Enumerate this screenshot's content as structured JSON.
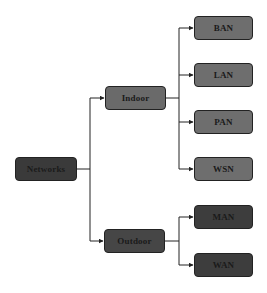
{
  "diagram": {
    "type": "tree",
    "root": {
      "label": "Networks",
      "color": "#3a3a3a",
      "box": {
        "x": 15,
        "y": 157,
        "w": 62,
        "h": 24
      },
      "children": [
        {
          "label": "Indoor",
          "color": "#6a6a6a",
          "box": {
            "x": 105,
            "y": 86,
            "w": 61,
            "h": 24
          },
          "children": [
            {
              "label": "BAN",
              "color": "#6e6e6e",
              "box": {
                "x": 194,
                "y": 16,
                "w": 59,
                "h": 24
              }
            },
            {
              "label": "LAN",
              "color": "#6e6e6e",
              "box": {
                "x": 194,
                "y": 63,
                "w": 59,
                "h": 24
              }
            },
            {
              "label": "PAN",
              "color": "#6e6e6e",
              "box": {
                "x": 194,
                "y": 110,
                "w": 59,
                "h": 24
              }
            },
            {
              "label": "WSN",
              "color": "#6e6e6e",
              "box": {
                "x": 194,
                "y": 157,
                "w": 59,
                "h": 24
              }
            }
          ]
        },
        {
          "label": "Outdoor",
          "color": "#464646",
          "box": {
            "x": 104,
            "y": 229,
            "w": 61,
            "h": 24
          },
          "children": [
            {
              "label": "MAN",
              "color": "#3d3d3d",
              "box": {
                "x": 194,
                "y": 205,
                "w": 59,
                "h": 24
              }
            },
            {
              "label": "WAN",
              "color": "#3d3d3d",
              "box": {
                "x": 194,
                "y": 253,
                "w": 59,
                "h": 24
              }
            }
          ]
        }
      ]
    },
    "edge_color": "#222222"
  },
  "labels": {
    "networks": "Networks",
    "indoor": "Indoor",
    "outdoor": "Outdoor",
    "ban": "BAN",
    "lan": "LAN",
    "pan": "PAN",
    "wsn": "WSN",
    "man": "MAN",
    "wan": "WAN"
  }
}
